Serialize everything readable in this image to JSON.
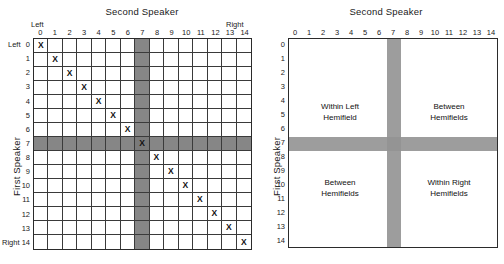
{
  "figure": {
    "panels": [
      {
        "id": "matrix-panel",
        "top_title": "Second Speaker",
        "side_title": "First Speaker",
        "caption_top_left": "Left",
        "caption_top_right": "Right",
        "caption_row_left": "Left",
        "caption_row_right": "Right",
        "col_ticks": [
          "0",
          "1",
          "2",
          "3",
          "4",
          "5",
          "6",
          "7",
          "8",
          "9",
          "10",
          "11",
          "12",
          "13",
          "14"
        ],
        "row_ticks": [
          "0",
          "1",
          "2",
          "3",
          "4",
          "5",
          "6",
          "7",
          "8",
          "9",
          "10",
          "11",
          "12",
          "13",
          "14"
        ],
        "mark_symbol": "X"
      },
      {
        "id": "quadrant-panel",
        "top_title": "Second Speaker",
        "side_title": "First Speaker",
        "col_ticks": [
          "0",
          "1",
          "2",
          "3",
          "4",
          "5",
          "6",
          "7",
          "8",
          "9",
          "10",
          "11",
          "12",
          "13",
          "14"
        ],
        "row_ticks": [
          "0",
          "1",
          "2",
          "3",
          "4",
          "5",
          "6",
          "7",
          "8",
          "9",
          "10",
          "11",
          "12",
          "13",
          "14"
        ],
        "quadrants": {
          "top_left_line1": "Within Left",
          "top_left_line2": "Hemifield",
          "top_right_line1": "Between",
          "top_right_line2": "Hemifields",
          "bottom_left_line1": "Between",
          "bottom_left_line2": "Hemifields",
          "bottom_right_line1": "Within Right",
          "bottom_right_line2": "Hemifields"
        }
      }
    ]
  },
  "chart_data": {
    "type": "heatmap",
    "xlabel": "Second Speaker",
    "ylabel": "First Speaker",
    "x": [
      0,
      1,
      2,
      3,
      4,
      5,
      6,
      7,
      8,
      9,
      10,
      11,
      12,
      13,
      14
    ],
    "y": [
      0,
      1,
      2,
      3,
      4,
      5,
      6,
      7,
      8,
      9,
      10,
      11,
      12,
      13,
      14
    ],
    "xlim": [
      0,
      14
    ],
    "ylim": [
      0,
      14
    ],
    "grid": true,
    "legend_position": "none",
    "axis_end_labels": {
      "x_min": "Left",
      "x_max": "Right",
      "y_min": "Left",
      "y_max": "Right"
    },
    "marked_cells": [
      {
        "row": 0,
        "col": 0,
        "label": "X"
      },
      {
        "row": 1,
        "col": 1,
        "label": "X"
      },
      {
        "row": 2,
        "col": 2,
        "label": "X"
      },
      {
        "row": 3,
        "col": 3,
        "label": "X"
      },
      {
        "row": 4,
        "col": 4,
        "label": "X"
      },
      {
        "row": 5,
        "col": 5,
        "label": "X"
      },
      {
        "row": 6,
        "col": 6,
        "label": "X"
      },
      {
        "row": 7,
        "col": 7,
        "label": "X"
      },
      {
        "row": 8,
        "col": 8,
        "label": "X"
      },
      {
        "row": 9,
        "col": 9,
        "label": "X"
      },
      {
        "row": 10,
        "col": 10,
        "label": "X"
      },
      {
        "row": 11,
        "col": 11,
        "label": "X"
      },
      {
        "row": 12,
        "col": 12,
        "label": "X"
      },
      {
        "row": 13,
        "col": 13,
        "label": "X"
      },
      {
        "row": 14,
        "col": 14,
        "label": "X"
      }
    ],
    "shaded_row": 7,
    "shaded_column": 7,
    "colors": {
      "shading": "#868686",
      "shading_light": "#9d9d9d",
      "gridline": "#3a3a3a",
      "border": "#2b2b2b",
      "background": "#ffffff"
    },
    "regions": [
      {
        "name": "Within Left Hemifield",
        "rows": [
          0,
          6
        ],
        "cols": [
          0,
          6
        ]
      },
      {
        "name": "Between Hemifields",
        "rows": [
          0,
          6
        ],
        "cols": [
          8,
          14
        ]
      },
      {
        "name": "Between Hemifields",
        "rows": [
          8,
          14
        ],
        "cols": [
          0,
          6
        ]
      },
      {
        "name": "Within Right Hemifields",
        "rows": [
          8,
          14
        ],
        "cols": [
          8,
          14
        ]
      }
    ]
  }
}
